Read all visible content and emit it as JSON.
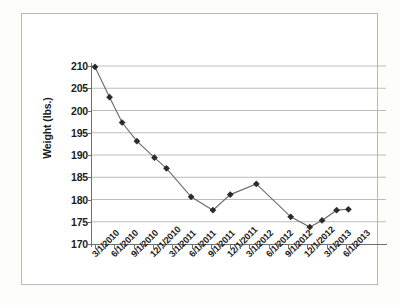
{
  "chart_data": {
    "type": "line",
    "title": "",
    "xlabel": "",
    "ylabel": "Weight (lbs.)",
    "ylim": [
      170,
      210
    ],
    "ytick_labels": [
      "210",
      "205",
      "200",
      "195",
      "190",
      "185",
      "180",
      "175",
      "170"
    ],
    "ytick_values": [
      210,
      205,
      200,
      195,
      190,
      185,
      180,
      175,
      170
    ],
    "grid": true,
    "legend": "none",
    "xtick_labels": [
      "3/1/2010",
      "6/1/2010",
      "9/1/2010",
      "12/1/2010",
      "3/1/2011",
      "6/1/2011",
      "9/1/2011",
      "12/1/2011",
      "3/1/2012",
      "6/1/2012",
      "9/1/2012",
      "12/1/2012",
      "3/1/2013",
      "6/1/2013"
    ],
    "x": [
      "3/1/2010",
      "4/15/2010",
      "6/1/2010",
      "7/15/2010",
      "9/1/2010",
      "10/15/2010",
      "12/15/2010",
      "3/1/2011",
      "7/15/2011",
      "9/15/2011",
      "12/15/2011",
      "3/15/2012",
      "9/1/2012",
      "12/15/2012",
      "2/1/2013",
      "4/15/2013",
      "6/15/2013"
    ],
    "values": [
      209.8,
      203.0,
      197.3,
      193.1,
      189.4,
      187.0,
      180.6,
      177.6,
      181.1,
      183.5,
      176.1,
      173.8,
      175.3,
      177.6,
      177.8,
      180.6,
      183.5
    ],
    "series": [
      {
        "name": "Weight",
        "points": [
          {
            "x": 0.0,
            "y": 209.8
          },
          {
            "x": 0.058,
            "y": 203.0
          },
          {
            "x": 0.108,
            "y": 197.3
          },
          {
            "x": 0.167,
            "y": 193.1
          },
          {
            "x": 0.237,
            "y": 189.4
          },
          {
            "x": 0.285,
            "y": 187.0
          },
          {
            "x": 0.383,
            "y": 180.6
          },
          {
            "x": 0.47,
            "y": 177.6
          },
          {
            "x": 0.539,
            "y": 181.1
          },
          {
            "x": 0.643,
            "y": 183.5
          },
          {
            "x": 0.78,
            "y": 176.1
          },
          {
            "x": 0.856,
            "y": 173.8
          },
          {
            "x": 0.905,
            "y": 175.3
          },
          {
            "x": 0.963,
            "y": 177.6
          },
          {
            "x": 1.01,
            "y": 177.8
          }
        ]
      }
    ],
    "marker": "diamond",
    "line_color": "#6d6d6d",
    "marker_color": "#2a2a2a",
    "grid_color": "#b4b4b4",
    "axis_color": "#6f6f6f"
  }
}
